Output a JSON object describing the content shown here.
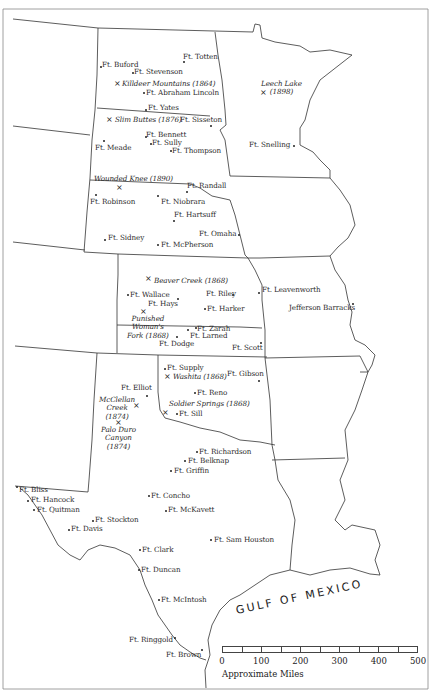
{
  "map": {
    "water_label": "GULF OF MEXICO",
    "scale": {
      "ticks": [
        "0",
        "100",
        "200",
        "300",
        "400",
        "500"
      ],
      "units_label": "Approximate Miles",
      "segments": 10
    },
    "forts": [
      {
        "name": "Ft. Totten",
        "x": 183,
        "y": 53,
        "dx": 183,
        "dy": 61
      },
      {
        "name": "Ft. Buford",
        "x": 102,
        "y": 61,
        "dx": 100,
        "dy": 66
      },
      {
        "name": "Ft. Stevenson",
        "x": 134,
        "y": 68,
        "dx": 132,
        "dy": 72
      },
      {
        "name": "Ft. Abraham Lincoln",
        "x": 146,
        "y": 89,
        "dx": 143,
        "dy": 92
      },
      {
        "name": "Ft. Yates",
        "x": 148,
        "y": 104,
        "dx": 145,
        "dy": 109
      },
      {
        "name": "Ft. Sisseton",
        "x": 180,
        "y": 116,
        "dx": 210,
        "dy": 125
      },
      {
        "name": "Ft. Bennett",
        "x": 146,
        "y": 131,
        "dx": 145,
        "dy": 136
      },
      {
        "name": "Ft. Sully",
        "x": 152,
        "y": 139,
        "dx": 150,
        "dy": 143
      },
      {
        "name": "Ft. Meade",
        "x": 95,
        "y": 144,
        "dx": 103,
        "dy": 140
      },
      {
        "name": "Ft. Thompson",
        "x": 172,
        "y": 147,
        "dx": 170,
        "dy": 150
      },
      {
        "name": "Ft. Snelling",
        "x": 249,
        "y": 141,
        "dx": 293,
        "dy": 145
      },
      {
        "name": "Ft. Randall",
        "x": 187,
        "y": 182,
        "dx": 186,
        "dy": 191
      },
      {
        "name": "Ft. Robinson",
        "x": 90,
        "y": 198,
        "dx": 95,
        "dy": 194
      },
      {
        "name": "Ft. Niobrara",
        "x": 161,
        "y": 198,
        "dx": 157,
        "dy": 195
      },
      {
        "name": "Ft. Hartsuff",
        "x": 174,
        "y": 211,
        "dx": 173,
        "dy": 220
      },
      {
        "name": "Ft. Omaha",
        "x": 199,
        "y": 230,
        "dx": 238,
        "dy": 234
      },
      {
        "name": "Ft. Sidney",
        "x": 108,
        "y": 234,
        "dx": 104,
        "dy": 239
      },
      {
        "name": "Ft. McPherson",
        "x": 161,
        "y": 241,
        "dx": 157,
        "dy": 244
      },
      {
        "name": "Ft. Leavenworth",
        "x": 262,
        "y": 286,
        "dx": 258,
        "dy": 292
      },
      {
        "name": "Jefferson Barracks",
        "x": 289,
        "y": 304,
        "dx": 352,
        "dy": 303
      },
      {
        "name": "Ft. Wallace",
        "x": 130,
        "y": 291,
        "dx": 127,
        "dy": 294
      },
      {
        "name": "Ft. Riley",
        "x": 206,
        "y": 290,
        "dx": 232,
        "dy": 294
      },
      {
        "name": "Ft. Hays",
        "x": 148,
        "y": 300,
        "dx": 177,
        "dy": 298
      },
      {
        "name": "Ft. Harker",
        "x": 207,
        "y": 305,
        "dx": 204,
        "dy": 308
      },
      {
        "name": "Ft. Zarah",
        "x": 197,
        "y": 325,
        "dx": 195,
        "dy": 327
      },
      {
        "name": "Ft. Larned",
        "x": 190,
        "y": 332,
        "dx": 187,
        "dy": 329
      },
      {
        "name": "Ft. Dodge",
        "x": 159,
        "y": 340,
        "dx": 176,
        "dy": 336
      },
      {
        "name": "Ft. Scott",
        "x": 232,
        "y": 344,
        "dx": 260,
        "dy": 342
      },
      {
        "name": "Ft. Supply",
        "x": 167,
        "y": 364,
        "dx": 164,
        "dy": 368
      },
      {
        "name": "Ft. Gibson",
        "x": 227,
        "y": 370,
        "dx": 258,
        "dy": 380
      },
      {
        "name": "Ft. Reno",
        "x": 197,
        "y": 389,
        "dx": 194,
        "dy": 392
      },
      {
        "name": "Ft. Elliot",
        "x": 121,
        "y": 384,
        "dx": 146,
        "dy": 395
      },
      {
        "name": "Ft. Sill",
        "x": 179,
        "y": 410,
        "dx": 176,
        "dy": 413
      },
      {
        "name": "Ft. Richardson",
        "x": 199,
        "y": 448,
        "dx": 196,
        "dy": 451
      },
      {
        "name": "Ft. Belknap",
        "x": 188,
        "y": 457,
        "dx": 184,
        "dy": 460
      },
      {
        "name": "Ft. Griffin",
        "x": 174,
        "y": 467,
        "dx": 170,
        "dy": 470
      },
      {
        "name": "Ft. Bliss",
        "x": 19,
        "y": 486,
        "dx": 16,
        "dy": 486
      },
      {
        "name": "Ft. Hancock",
        "x": 31,
        "y": 496,
        "dx": 27,
        "dy": 500
      },
      {
        "name": "Ft. Concho",
        "x": 151,
        "y": 492,
        "dx": 148,
        "dy": 495
      },
      {
        "name": "Ft. Quitman",
        "x": 37,
        "y": 506,
        "dx": 33,
        "dy": 509
      },
      {
        "name": "Ft. McKavett",
        "x": 168,
        "y": 506,
        "dx": 165,
        "dy": 510
      },
      {
        "name": "Ft. Stockton",
        "x": 95,
        "y": 516,
        "dx": 92,
        "dy": 520
      },
      {
        "name": "Ft. Davis",
        "x": 71,
        "y": 525,
        "dx": 68,
        "dy": 529
      },
      {
        "name": "Ft. Sam Houston",
        "x": 214,
        "y": 536,
        "dx": 210,
        "dy": 539
      },
      {
        "name": "Ft. Clark",
        "x": 142,
        "y": 546,
        "dx": 139,
        "dy": 549
      },
      {
        "name": "Ft. Duncan",
        "x": 141,
        "y": 566,
        "dx": 138,
        "dy": 569
      },
      {
        "name": "Ft. McIntosh",
        "x": 161,
        "y": 596,
        "dx": 158,
        "dy": 599
      },
      {
        "name": "Ft. Ringgold",
        "x": 129,
        "y": 636,
        "dx": 174,
        "dy": 637
      },
      {
        "name": "Ft. Brown",
        "x": 166,
        "y": 651,
        "dx": 201,
        "dy": 649
      }
    ],
    "battles": [
      {
        "name": "Killdeer Mountains (1864)",
        "x": 122,
        "y": 80,
        "mx": 114,
        "my": 80
      },
      {
        "name": "Slim Buttes (1876)",
        "x": 115,
        "y": 116,
        "mx": 106,
        "my": 116
      },
      {
        "name": "Wounded Knee (1890)",
        "x": 94,
        "y": 175,
        "mx": 116,
        "my": 184
      },
      {
        "name": "Leech Lake\n(1898)",
        "x": 261,
        "y": 80,
        "mx": 260,
        "my": 89
      },
      {
        "name": "Beaver Creek (1868)",
        "x": 154,
        "y": 277,
        "mx": 145,
        "my": 275
      },
      {
        "name": "Punished\nWoman's\nFork (1868)",
        "x": 127,
        "y": 315,
        "mx": 140,
        "my": 308
      },
      {
        "name": "Washita (1868)",
        "x": 173,
        "y": 373,
        "mx": 164,
        "my": 373
      },
      {
        "name": "Soldier Springs (1868)",
        "x": 169,
        "y": 400,
        "mx": 162,
        "my": 409
      },
      {
        "name": "McClellan\nCreek\n(1874)",
        "x": 99,
        "y": 396,
        "mx": 133,
        "my": 402
      },
      {
        "name": "Palo Duro\nCanyon\n(1874)",
        "x": 101,
        "y": 426,
        "mx": 115,
        "my": 419
      }
    ]
  }
}
